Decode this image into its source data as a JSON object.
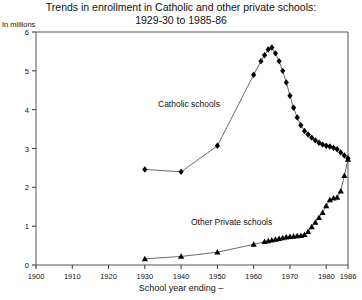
{
  "chart_title_line1": "Trends in enrollment in Catholic and other private schools:",
  "chart_title_line2": "1929-30 to 1985-86",
  "units_label": "In millions",
  "xaxis_title": "School year ending –",
  "series_label_catholic": "Catholic schools",
  "series_label_other": "Other Private schools",
  "chart_data": {
    "type": "line",
    "title": "Trends in enrollment in Catholic and other private schools: 1929-30 to 1985-86",
    "xlabel": "School year ending –",
    "ylabel": "In millions",
    "xlim": [
      1900,
      1986
    ],
    "ylim": [
      0,
      6
    ],
    "xticks": [
      1900,
      1910,
      1920,
      1930,
      1940,
      1950,
      1960,
      1970,
      1980,
      1986
    ],
    "yticks": [
      0,
      1,
      2,
      3,
      4,
      5,
      6
    ],
    "grid": false,
    "legend": "inline-annotation",
    "series": [
      {
        "name": "Catholic schools",
        "marker": "diamond",
        "color": "#000000",
        "points": [
          [
            1930,
            2.46
          ],
          [
            1940,
            2.4
          ],
          [
            1950,
            3.07
          ],
          [
            1960,
            4.9
          ],
          [
            1962,
            5.25
          ],
          [
            1963,
            5.4
          ],
          [
            1964,
            5.55
          ],
          [
            1965,
            5.6
          ],
          [
            1966,
            5.45
          ],
          [
            1967,
            5.25
          ],
          [
            1968,
            5.0
          ],
          [
            1969,
            4.7
          ],
          [
            1970,
            4.36
          ],
          [
            1971,
            4.05
          ],
          [
            1972,
            3.8
          ],
          [
            1973,
            3.6
          ],
          [
            1974,
            3.45
          ],
          [
            1975,
            3.36
          ],
          [
            1976,
            3.28
          ],
          [
            1977,
            3.21
          ],
          [
            1978,
            3.15
          ],
          [
            1979,
            3.1
          ],
          [
            1980,
            3.07
          ],
          [
            1981,
            3.05
          ],
          [
            1982,
            3.02
          ],
          [
            1983,
            2.98
          ],
          [
            1984,
            2.9
          ],
          [
            1985,
            2.82
          ],
          [
            1986,
            2.75
          ]
        ]
      },
      {
        "name": "Other Private schools",
        "marker": "triangle",
        "color": "#000000",
        "points": [
          [
            1930,
            0.16
          ],
          [
            1940,
            0.22
          ],
          [
            1950,
            0.33
          ],
          [
            1960,
            0.53
          ],
          [
            1963,
            0.6
          ],
          [
            1964,
            0.62
          ],
          [
            1965,
            0.64
          ],
          [
            1966,
            0.66
          ],
          [
            1967,
            0.68
          ],
          [
            1968,
            0.7
          ],
          [
            1969,
            0.72
          ],
          [
            1970,
            0.73
          ],
          [
            1971,
            0.74
          ],
          [
            1972,
            0.75
          ],
          [
            1973,
            0.76
          ],
          [
            1974,
            0.78
          ],
          [
            1975,
            0.86
          ],
          [
            1976,
            0.98
          ],
          [
            1977,
            1.1
          ],
          [
            1978,
            1.22
          ],
          [
            1979,
            1.35
          ],
          [
            1980,
            1.52
          ],
          [
            1981,
            1.68
          ],
          [
            1982,
            1.72
          ],
          [
            1983,
            1.74
          ],
          [
            1984,
            1.9
          ],
          [
            1985,
            2.3
          ],
          [
            1986,
            2.72
          ]
        ]
      }
    ]
  }
}
